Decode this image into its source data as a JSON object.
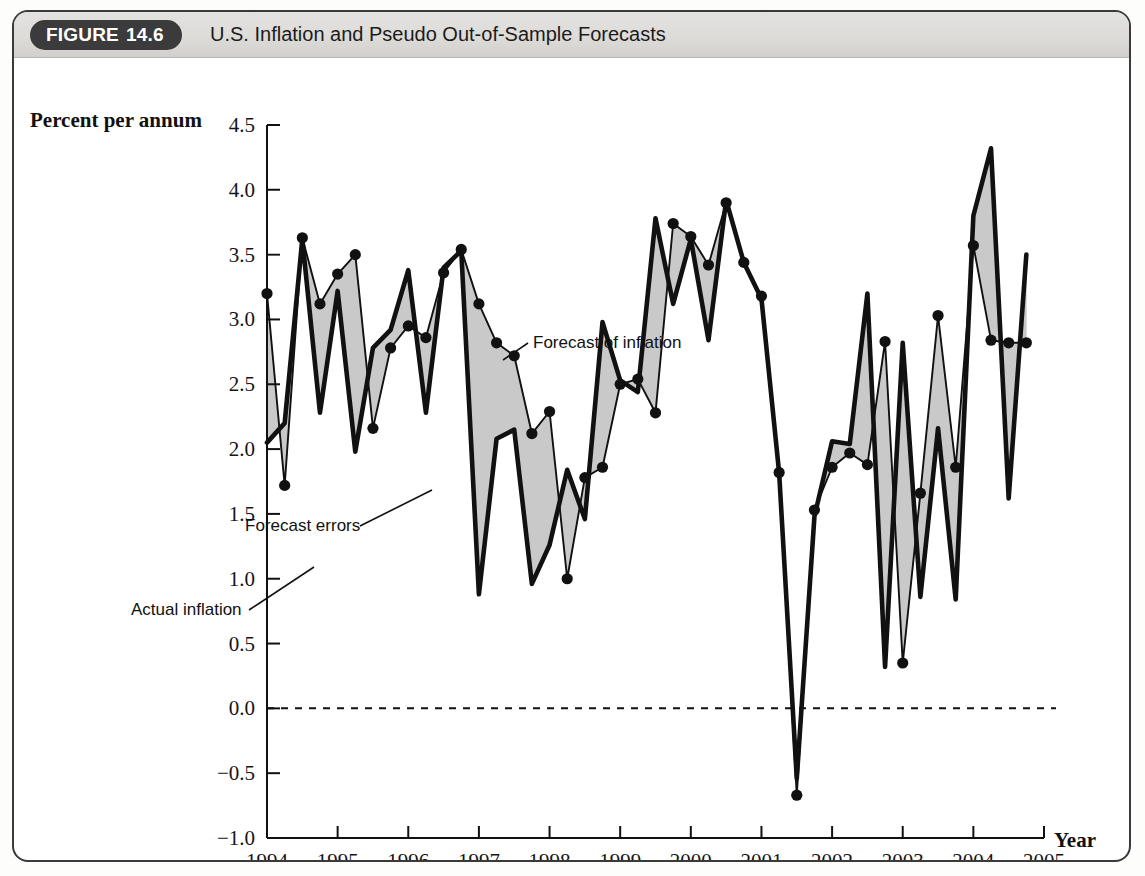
{
  "figure": {
    "badge_word": "FIGURE",
    "badge_number": "14.6",
    "title": "U.S. Inflation and Pseudo Out-of-Sample Forecasts"
  },
  "axes": {
    "y_title": "Percent per annum",
    "x_title": "Year",
    "y_ticks": [
      "4.5",
      "4.0",
      "3.5",
      "3.0",
      "2.5",
      "2.0",
      "1.5",
      "1.0",
      "0.5",
      "0.0",
      "-0.5",
      "-1.0"
    ],
    "x_ticks": [
      "1994",
      "1995",
      "1996",
      "1997",
      "1998",
      "1999",
      "2000",
      "2001",
      "2002",
      "2003",
      "2004",
      "2005"
    ]
  },
  "annotations": [
    {
      "id": "forecast-of-inflation",
      "label": "Forecast of inflation"
    },
    {
      "id": "forecast-errors",
      "label": "Forecast errors"
    },
    {
      "id": "actual-inflation",
      "label": "Actual inflation"
    }
  ],
  "colors": {
    "line": "#111111",
    "fill": "#c9c9c9",
    "frame": "#3a3a3a",
    "header": "#dedcd9",
    "badge": "#3b3b3b"
  },
  "chart_data": {
    "type": "line",
    "title": "U.S. Inflation and Pseudo Out-of-Sample Forecasts",
    "xlabel": "Year",
    "ylabel": "Percent per annum",
    "xlim": [
      1994.0,
      2005.0
    ],
    "ylim": [
      -1.0,
      4.5
    ],
    "ytick_step": 0.5,
    "grid": false,
    "legend": "annotations",
    "zero_line": 0.0,
    "frequency": "quarterly",
    "x": [
      1994.0,
      1994.25,
      1994.5,
      1994.75,
      1995.0,
      1995.25,
      1995.5,
      1995.75,
      1996.0,
      1996.25,
      1996.5,
      1996.75,
      1997.0,
      1997.25,
      1997.5,
      1997.75,
      1998.0,
      1998.25,
      1998.5,
      1998.75,
      1999.0,
      1999.25,
      1999.5,
      1999.75,
      2000.0,
      2000.25,
      2000.5,
      2000.75,
      2001.0,
      2001.25,
      2001.5,
      2001.75,
      2002.0,
      2002.25,
      2002.5,
      2002.75,
      2003.0,
      2003.25,
      2003.5,
      2003.75,
      2004.0,
      2004.25,
      2004.5,
      2004.75
    ],
    "series": [
      {
        "name": "Actual inflation",
        "style": "thick-solid",
        "markers": false,
        "values": [
          2.05,
          2.2,
          3.62,
          2.28,
          3.22,
          1.98,
          2.78,
          2.92,
          3.38,
          2.28,
          3.4,
          3.53,
          0.88,
          2.08,
          2.15,
          0.96,
          1.26,
          1.84,
          1.46,
          2.98,
          2.53,
          2.44,
          3.78,
          3.12,
          3.62,
          2.84,
          3.92,
          3.44,
          3.16,
          1.82,
          -0.54,
          1.48,
          2.06,
          2.04,
          3.2,
          0.32,
          2.82,
          0.86,
          2.16,
          0.84,
          3.8,
          4.32,
          1.62,
          3.5
        ]
      },
      {
        "name": "Forecast of inflation",
        "style": "thin-solid",
        "markers": true,
        "values": [
          3.2,
          1.72,
          3.63,
          3.12,
          3.35,
          3.5,
          2.16,
          2.78,
          2.95,
          2.86,
          3.36,
          3.54,
          3.12,
          2.82,
          2.72,
          2.12,
          2.29,
          1.0,
          1.78,
          1.86,
          2.5,
          2.54,
          2.28,
          3.74,
          3.64,
          3.42,
          3.9,
          3.44,
          3.18,
          1.82,
          -0.67,
          1.53,
          1.86,
          1.97,
          1.88,
          2.83,
          0.35,
          1.66,
          3.03,
          1.86,
          3.57,
          2.84,
          2.82,
          2.82
        ]
      }
    ]
  }
}
